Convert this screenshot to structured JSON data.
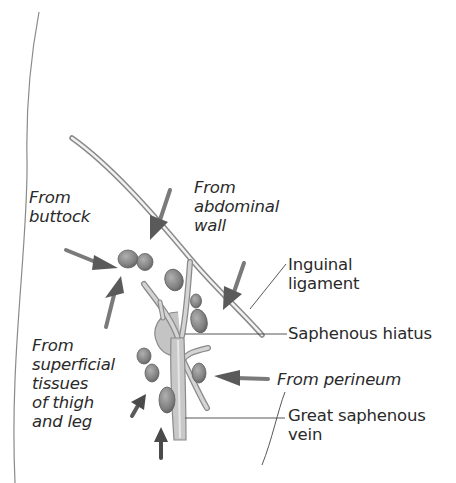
{
  "diagram": {
    "colors": {
      "background": "#ffffff",
      "text": "#2a2a2a",
      "vein_fill": "#c6c6c6",
      "vein_edge": "#8a8a8a",
      "node_fill": "#8c8c8c",
      "node_edge": "#5e5e5e",
      "arrow_fill": "#6e6e6e",
      "leader_line": "#444444"
    },
    "labels": {
      "from_buttock": "From\nbuttock",
      "from_abdominal_wall": "From\nabdominal\nwall",
      "inguinal_ligament": "Inguinal\nligament",
      "saphenous_hiatus": "Saphenous hiatus",
      "from_superficial": "From\nsuperficial\ntissues\nof thigh\nand leg",
      "from_perineum": "From perineum",
      "great_saphenous_vein": "Great saphenous\nvein"
    }
  }
}
